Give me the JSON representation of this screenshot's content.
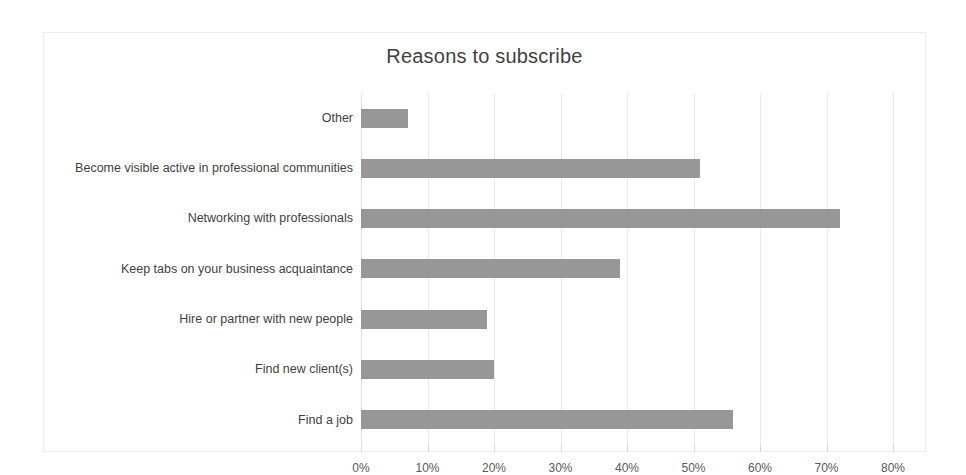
{
  "chart_data": {
    "type": "bar",
    "orientation": "horizontal",
    "title": "Reasons to subscribe",
    "xlabel": "",
    "ylabel": "",
    "xlim": [
      0,
      80
    ],
    "grid": true,
    "legend": "none",
    "bar_color": "#8e8e8e",
    "gridline_color": "#e9e9e9",
    "frame_color": "#ededed",
    "categories": [
      "Other",
      "Become visible active in professional communities",
      "Networking with professionals",
      "Keep tabs on your business acquaintance",
      "Hire or partner with new people",
      "Find new client(s)",
      "Find a job"
    ],
    "values": [
      7,
      51,
      72,
      39,
      19,
      20,
      56
    ],
    "value_unit": "%",
    "tick_labels": [
      "0%",
      "10%",
      "20%",
      "30%",
      "40%",
      "50%",
      "60%",
      "70%",
      "80%"
    ],
    "tick_values": [
      0,
      10,
      20,
      30,
      40,
      50,
      60,
      70,
      80
    ]
  }
}
